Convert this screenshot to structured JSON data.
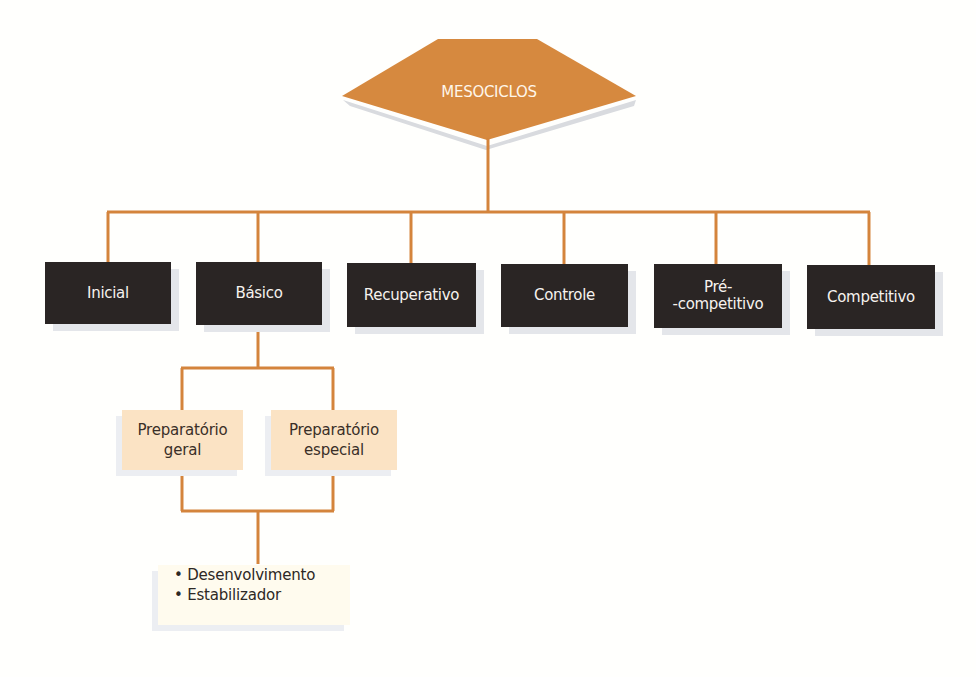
{
  "root": {
    "label": "MESOCICLOS",
    "color": "#d6893f"
  },
  "line_color": "#d4843c",
  "level1": [
    {
      "label": "Inicial"
    },
    {
      "label": "Básico"
    },
    {
      "label": "Recuperativo"
    },
    {
      "label": "Controle"
    },
    {
      "label": "Pré-",
      "label2": "-competitivo"
    },
    {
      "label": "Competitivo"
    }
  ],
  "basico_children": [
    {
      "line1": "Preparatório",
      "line2": "geral"
    },
    {
      "line1": "Preparatório",
      "line2": "especial"
    }
  ],
  "preparatorio_types": [
    "• Desenvolvimento",
    "• Estabilizador"
  ]
}
